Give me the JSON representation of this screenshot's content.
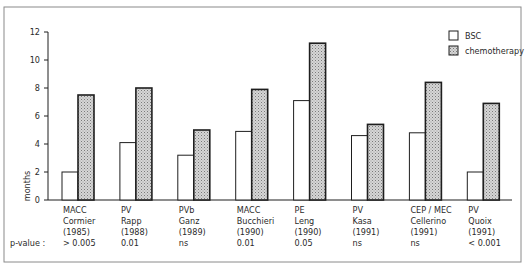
{
  "chart_data": {
    "type": "bar",
    "title": "",
    "xlabel": "",
    "ylabel": "months",
    "ylim": [
      0,
      12
    ],
    "yticks": [
      0,
      2,
      4,
      6,
      8,
      10,
      12
    ],
    "grid": false,
    "legend_position": "top-right",
    "categories": [
      {
        "regimen": "MACC",
        "author": "Cormier",
        "year": "(1985)",
        "p_value": "> 0.005"
      },
      {
        "regimen": "PV",
        "author": "Rapp",
        "year": "(1988)",
        "p_value": "0.01"
      },
      {
        "regimen": "PVb",
        "author": "Ganz",
        "year": "(1989)",
        "p_value": "ns"
      },
      {
        "regimen": "MACC",
        "author": "Bucchieri",
        "year": "(1990)",
        "p_value": "0.01"
      },
      {
        "regimen": "PE",
        "author": "Leng",
        "year": "(1990)",
        "p_value": "0.05"
      },
      {
        "regimen": "PV",
        "author": "Kasa",
        "year": "(1991)",
        "p_value": "ns"
      },
      {
        "regimen": "CEP / MEC",
        "author": "Cellerino",
        "year": "(1991)",
        "p_value": "ns"
      },
      {
        "regimen": "PV",
        "author": "Quoix",
        "year": "(1991)",
        "p_value": "< 0.001"
      }
    ],
    "p_value_label": "p-value :",
    "series": [
      {
        "name": "BSC",
        "fill": "#ffffff",
        "values": [
          2.0,
          4.1,
          3.2,
          4.9,
          7.1,
          4.6,
          4.8,
          2.0
        ]
      },
      {
        "name": "chemotherapy",
        "fill": "#c8c8c8",
        "values": [
          7.5,
          8.0,
          5.0,
          7.9,
          11.2,
          5.4,
          8.4,
          6.9
        ]
      }
    ]
  },
  "colors": {
    "stroke": "#1e1e1e",
    "frame": "#8a8a8a"
  }
}
